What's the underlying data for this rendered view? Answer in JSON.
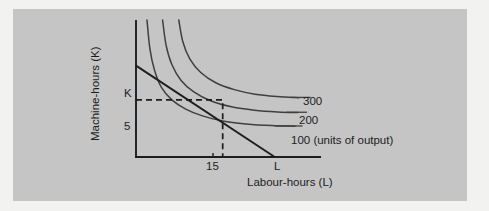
{
  "figure": {
    "background_color": "#f2f2f0",
    "panel_color": "#c5c5c5",
    "ink_color": "#1d1d1d",
    "curve_color": "#3a3a3a"
  },
  "axes": {
    "y_title": "Machine-hours (K)",
    "x_title": "Labour-hours (L)",
    "y_ticks": [
      {
        "label": "5",
        "value": 5
      },
      {
        "label": "K",
        "value": 8
      }
    ],
    "x_ticks": [
      {
        "label": "15",
        "value": 15
      },
      {
        "label": "L",
        "value": 24
      }
    ]
  },
  "chart_data": {
    "type": "line",
    "title": "",
    "subtitle": "",
    "xlabel": "Labour-hours (L)",
    "ylabel": "Machine-hours (K)",
    "grid": false,
    "legend_position": "right-inline",
    "xlim": [
      0,
      32
    ],
    "ylim": [
      0,
      12
    ],
    "annotations": [
      {
        "name": "K-intercept",
        "label": "K",
        "x": 0,
        "y": 8
      },
      {
        "name": "L-intercept",
        "label": "L",
        "x": 24,
        "y": 0
      },
      {
        "name": "tangency-K",
        "label": "5",
        "x": 0,
        "y": 5
      },
      {
        "name": "tangency-L",
        "label": "15",
        "x": 15,
        "y": 0
      }
    ],
    "series": [
      {
        "name": "isoquant-100",
        "label": "100 (units of output)",
        "type": "isoquant",
        "output": 100,
        "points": [
          {
            "x": 1.9,
            "y": 12
          },
          {
            "x": 2.4,
            "y": 9.5
          },
          {
            "x": 3.2,
            "y": 7.6
          },
          {
            "x": 4.4,
            "y": 6.1
          },
          {
            "x": 6.2,
            "y": 5.0
          },
          {
            "x": 8.6,
            "y": 4.2
          },
          {
            "x": 11.5,
            "y": 3.6
          },
          {
            "x": 15.0,
            "y": 3.15
          },
          {
            "x": 19.0,
            "y": 2.9
          },
          {
            "x": 23.5,
            "y": 2.75
          },
          {
            "x": 27.5,
            "y": 2.7
          }
        ]
      },
      {
        "name": "isoquant-200",
        "label": "200",
        "type": "isoquant",
        "output": 200,
        "points": [
          {
            "x": 4.6,
            "y": 12
          },
          {
            "x": 5.2,
            "y": 9.8
          },
          {
            "x": 6.2,
            "y": 8.1
          },
          {
            "x": 7.8,
            "y": 6.7
          },
          {
            "x": 10.0,
            "y": 5.7
          },
          {
            "x": 13.0,
            "y": 4.9
          },
          {
            "x": 16.5,
            "y": 4.4
          },
          {
            "x": 20.5,
            "y": 4.1
          },
          {
            "x": 24.5,
            "y": 3.95
          },
          {
            "x": 28.0,
            "y": 3.9
          }
        ]
      },
      {
        "name": "isoquant-300",
        "label": "300",
        "type": "isoquant",
        "output": 300,
        "points": [
          {
            "x": 7.4,
            "y": 12
          },
          {
            "x": 8.1,
            "y": 10.1
          },
          {
            "x": 9.3,
            "y": 8.6
          },
          {
            "x": 11.2,
            "y": 7.4
          },
          {
            "x": 13.8,
            "y": 6.5
          },
          {
            "x": 17.0,
            "y": 5.9
          },
          {
            "x": 20.6,
            "y": 5.5
          },
          {
            "x": 24.4,
            "y": 5.3
          },
          {
            "x": 28.2,
            "y": 5.2
          }
        ]
      },
      {
        "name": "isocost-line",
        "label": "",
        "type": "isocost",
        "points": [
          {
            "x": 0,
            "y": 8
          },
          {
            "x": 24,
            "y": 0
          }
        ]
      }
    ],
    "guides": [
      {
        "name": "tangency-guide",
        "style": "dashed",
        "points": [
          {
            "x": 0,
            "y": 5
          },
          {
            "x": 15,
            "y": 5
          },
          {
            "x": 15,
            "y": 0
          }
        ]
      }
    ],
    "leader_lines": [
      {
        "name": "leader-300",
        "from": {
          "x": 26.8,
          "y": 5.22
        },
        "to": {
          "x": 30.2,
          "y": 5.22
        }
      },
      {
        "name": "leader-200",
        "from": {
          "x": 26.0,
          "y": 3.92
        },
        "to": {
          "x": 29.6,
          "y": 3.92
        }
      },
      {
        "name": "leader-100",
        "from": {
          "x": 24.0,
          "y": 2.72
        },
        "to": {
          "x": 28.8,
          "y": 2.72
        }
      }
    ]
  }
}
